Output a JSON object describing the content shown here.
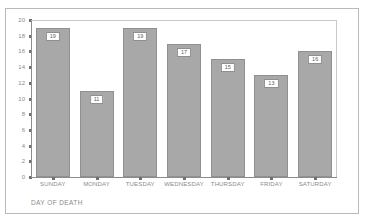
{
  "chart_data": {
    "type": "bar",
    "title": "",
    "subtitle": "",
    "xlabel": "DAY OF DEATH",
    "ylabel": "",
    "categories": [
      "SUNDAY",
      "MONDAY",
      "TUESDAY",
      "WEDNESDAY",
      "THURSDAY",
      "FRIDAY",
      "SATURDAY"
    ],
    "values": [
      19,
      11,
      19,
      17,
      15,
      13,
      16
    ],
    "value_labels": [
      "19",
      "11",
      "19",
      "17",
      "15",
      "13",
      "16"
    ],
    "ylim": [
      0,
      20
    ],
    "ytick_labels": [
      "20",
      "18",
      "16",
      "14",
      "12",
      "10",
      "8",
      "6",
      "4",
      "2",
      "0"
    ],
    "ytick_values": [
      20,
      18,
      16,
      14,
      12,
      10,
      8,
      6,
      4,
      2,
      0
    ],
    "grid": false,
    "legend": null,
    "legend_position": "none",
    "colors": {
      "bar_fill": "#a8a8a8",
      "bar_border": "#909090",
      "axis_line": "#8c8c8c",
      "frame_border": "#b9b9b9",
      "text": "#8a8a8a",
      "value_label_text": "#5d5d5d",
      "value_label_bg": "#ffffff",
      "background": "#ffffff"
    }
  }
}
